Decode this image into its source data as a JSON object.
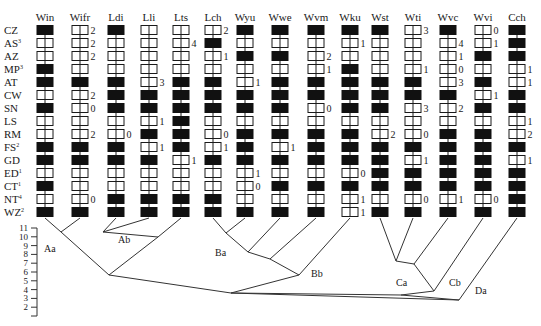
{
  "rows": [
    "CZ",
    "AS",
    "AZ",
    "MP",
    "AT",
    "CW",
    "SN",
    "LS",
    "RM",
    "FS",
    "GD",
    "ED",
    "CT",
    "NT",
    "WZ"
  ],
  "row_superscripts": {
    "AS": "3",
    "MP": "3",
    "FS": "2",
    "ED": "1",
    "CT": "1",
    "NT": "4",
    "WZ": "2"
  },
  "columns": [
    {
      "name": "Win",
      "x": 45,
      "cells": [
        "B",
        "W",
        "W",
        "B",
        "B",
        "W",
        "B",
        "W",
        "W",
        "B",
        "B",
        "W",
        "B",
        "W",
        "B"
      ],
      "marks": {}
    },
    {
      "name": "Wifr",
      "x": 80,
      "cells": [
        "W",
        "W",
        "W",
        "W",
        "B",
        "W",
        "W",
        "W",
        "W",
        "B",
        "B",
        "W",
        "W",
        "W",
        "B"
      ],
      "marks": {
        "CZ": "2",
        "AS": "2",
        "AZ": "2",
        "CW": "2",
        "SN": "0",
        "RM": "2",
        "NT": "0"
      }
    },
    {
      "name": "Ldi",
      "x": 116,
      "cells": [
        "B",
        "W",
        "W",
        "W",
        "B",
        "B",
        "B",
        "W",
        "W",
        "B",
        "B",
        "W",
        "W",
        "B",
        "B"
      ],
      "marks": {
        "RM": "0"
      }
    },
    {
      "name": "Lli",
      "x": 149,
      "cells": [
        "W",
        "W",
        "W",
        "W",
        "W",
        "B",
        "B",
        "W",
        "B",
        "W",
        "B",
        "W",
        "W",
        "B",
        "B"
      ],
      "marks": {
        "AT": "3",
        "LS": "1",
        "FS": "1"
      }
    },
    {
      "name": "Lts",
      "x": 181,
      "cells": [
        "W",
        "W",
        "W",
        "W",
        "B",
        "B",
        "B",
        "B",
        "B",
        "B",
        "W",
        "W",
        "W",
        "B",
        "B"
      ],
      "marks": {
        "AS": "4",
        "GD": "1"
      }
    },
    {
      "name": "Lch",
      "x": 213,
      "cells": [
        "W",
        "B",
        "W",
        "W",
        "B",
        "B",
        "B",
        "W",
        "W",
        "W",
        "B",
        "W",
        "W",
        "B",
        "B"
      ],
      "marks": {
        "CZ": "2",
        "AZ": "1",
        "RM": "0",
        "FS": "1"
      }
    },
    {
      "name": "Wyu",
      "x": 245,
      "cells": [
        "B",
        "W",
        "B",
        "W",
        "W",
        "B",
        "B",
        "W",
        "B",
        "B",
        "B",
        "W",
        "W",
        "W",
        "B"
      ],
      "marks": {
        "AT": "1",
        "ED": "1",
        "CT": "0"
      }
    },
    {
      "name": "Wwe",
      "x": 280,
      "cells": [
        "B",
        "W",
        "B",
        "W",
        "B",
        "B",
        "B",
        "W",
        "B",
        "W",
        "B",
        "W",
        "B",
        "W",
        "B"
      ],
      "marks": {
        "FS": "1"
      }
    },
    {
      "name": "Wvm",
      "x": 316,
      "cells": [
        "B",
        "W",
        "W",
        "W",
        "B",
        "B",
        "W",
        "W",
        "B",
        "B",
        "B",
        "W",
        "B",
        "W",
        "B"
      ],
      "marks": {
        "AZ": "2",
        "MP": "1",
        "SN": "0"
      }
    },
    {
      "name": "Wku",
      "x": 350,
      "cells": [
        "B",
        "W",
        "W",
        "B",
        "B",
        "B",
        "B",
        "W",
        "B",
        "B",
        "B",
        "W",
        "B",
        "W",
        "W"
      ],
      "marks": {
        "AS": "1",
        "ED": "0",
        "NT": "1",
        "WZ": "1"
      }
    },
    {
      "name": "Wst",
      "x": 380,
      "cells": [
        "B",
        "W",
        "W",
        "W",
        "B",
        "B",
        "B",
        "W",
        "W",
        "B",
        "B",
        "B",
        "B",
        "W",
        "B"
      ],
      "marks": {
        "RM": "2"
      }
    },
    {
      "name": "Wti",
      "x": 413,
      "cells": [
        "W",
        "W",
        "W",
        "W",
        "B",
        "B",
        "W",
        "W",
        "W",
        "B",
        "W",
        "B",
        "B",
        "W",
        "B"
      ],
      "marks": {
        "CZ": "3",
        "MP": "1",
        "SN": "3",
        "RM": "0",
        "GD": "1",
        "NT": "0"
      }
    },
    {
      "name": "Wvc",
      "x": 448,
      "cells": [
        "B",
        "W",
        "W",
        "W",
        "W",
        "B",
        "W",
        "W",
        "B",
        "B",
        "B",
        "B",
        "B",
        "W",
        "B"
      ],
      "marks": {
        "AS": "4",
        "AZ": "1",
        "MP": "0",
        "AT": "3",
        "SN": "2",
        "NT": "1"
      }
    },
    {
      "name": "Wvi",
      "x": 483,
      "cells": [
        "W",
        "W",
        "B",
        "W",
        "B",
        "W",
        "B",
        "W",
        "B",
        "B",
        "B",
        "B",
        "B",
        "W",
        "B"
      ],
      "marks": {
        "CZ": "0",
        "AS": "1",
        "CW": "1",
        "NT": "0"
      }
    },
    {
      "name": "Cch",
      "x": 517,
      "cells": [
        "B",
        "B",
        "B",
        "W",
        "W",
        "B",
        "B",
        "W",
        "W",
        "B",
        "W",
        "B",
        "B",
        "B",
        "B"
      ],
      "marks": {
        "MP": "1",
        "AT": "1",
        "LS": "1",
        "RM": "2",
        "GD": "1"
      }
    }
  ],
  "axis": {
    "ticks": [
      "11",
      "10",
      "9",
      "8",
      "7",
      "6",
      "5",
      "4",
      "3",
      "2"
    ]
  },
  "clade_labels": [
    {
      "text": "Aa",
      "x": 44,
      "y": 252
    },
    {
      "text": "Ab",
      "x": 118,
      "y": 243
    },
    {
      "text": "Ba",
      "x": 215,
      "y": 256
    },
    {
      "text": "Bb",
      "x": 311,
      "y": 277
    },
    {
      "text": "Ca",
      "x": 396,
      "y": 286
    },
    {
      "text": "Cb",
      "x": 449,
      "y": 286
    },
    {
      "text": "Da",
      "x": 475,
      "y": 294
    }
  ],
  "tree_edges": [
    [
      45,
      218,
      61,
      232
    ],
    [
      80,
      218,
      61,
      232
    ],
    [
      61,
      232,
      109,
      275
    ],
    [
      116,
      218,
      103,
      232
    ],
    [
      149,
      218,
      103,
      232
    ],
    [
      103,
      232,
      158,
      237
    ],
    [
      181,
      218,
      158,
      237
    ],
    [
      158,
      237,
      109,
      275
    ],
    [
      109,
      275,
      231,
      293
    ],
    [
      213,
      218,
      226,
      233
    ],
    [
      245,
      218,
      226,
      233
    ],
    [
      226,
      233,
      248,
      252
    ],
    [
      280,
      218,
      248,
      252
    ],
    [
      248,
      252,
      270,
      259
    ],
    [
      316,
      218,
      270,
      259
    ],
    [
      270,
      259,
      299,
      275
    ],
    [
      350,
      218,
      299,
      275
    ],
    [
      299,
      275,
      231,
      293
    ],
    [
      380,
      218,
      396,
      261
    ],
    [
      413,
      218,
      396,
      261
    ],
    [
      396,
      261,
      414,
      264
    ],
    [
      448,
      218,
      414,
      264
    ],
    [
      414,
      264,
      434,
      291
    ],
    [
      483,
      218,
      434,
      291
    ],
    [
      434,
      291,
      401,
      295
    ],
    [
      231,
      293,
      401,
      295
    ],
    [
      401,
      295,
      459,
      300
    ],
    [
      231,
      293,
      459,
      300
    ],
    [
      517,
      218,
      459,
      300
    ]
  ]
}
